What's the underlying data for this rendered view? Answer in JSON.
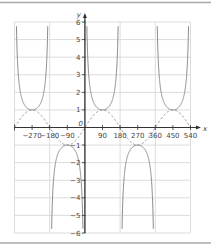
{
  "chart_data": {
    "type": "line",
    "title": "",
    "xlabel": "x",
    "ylabel": "y",
    "xlim": [
      -360,
      540
    ],
    "ylim": [
      -6,
      6
    ],
    "grid": true,
    "legend": null,
    "x_ticks": [
      -270,
      -180,
      -90,
      90,
      180,
      270,
      360,
      450,
      540
    ],
    "x_tick_labels": [
      "−270",
      "−180",
      "−90",
      "90",
      "180",
      "270",
      "360",
      "450",
      "540"
    ],
    "y_ticks": [
      6,
      5,
      4,
      3,
      2,
      1,
      -1,
      -2,
      -3,
      -4,
      -5,
      -6
    ],
    "y_tick_labels": [
      "6",
      "5",
      "4",
      "3",
      "2",
      "1",
      "−1",
      "−2",
      "−3",
      "−4",
      "−5",
      "−6"
    ],
    "origin_label": "0",
    "series": [
      {
        "name": "y = cosec x",
        "style": "solid",
        "color": "#8a8a8a",
        "asymptotes": [
          -360,
          -180,
          0,
          180,
          360,
          540
        ],
        "turning_points": [
          [
            -270,
            1
          ],
          [
            -90,
            -1
          ],
          [
            90,
            1
          ],
          [
            270,
            -1
          ],
          [
            450,
            1
          ]
        ]
      },
      {
        "name": "y = sin x",
        "style": "dashed",
        "color": "#8a8a8a",
        "x": [
          -360,
          -270,
          -180,
          -90,
          0,
          90,
          180,
          270,
          360,
          450,
          540
        ],
        "values": [
          0,
          1,
          0,
          -1,
          0,
          1,
          0,
          -1,
          0,
          1,
          0
        ]
      }
    ]
  },
  "colors": {
    "grid": "#dcdcdc",
    "axis": "#333333",
    "curve": "#8a8a8a",
    "border": "#a0a0a0"
  }
}
